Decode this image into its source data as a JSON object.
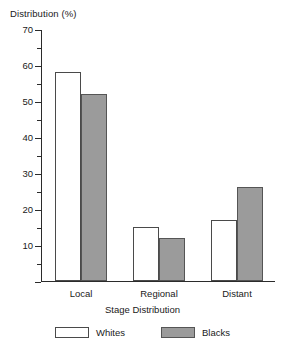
{
  "chart_data": {
    "type": "bar",
    "title": "",
    "ylabel": "Distribution (%)",
    "xlabel": "Stage Distribution",
    "categories": [
      "Local",
      "Regional",
      "Distant"
    ],
    "series": [
      {
        "name": "Whites",
        "values": [
          58,
          15,
          17
        ],
        "color": "#ffffff"
      },
      {
        "name": "Blacks",
        "values": [
          52,
          12,
          26
        ],
        "color": "#9b9b9b"
      }
    ],
    "ylim": [
      0,
      70
    ],
    "y_major_ticks": [
      0,
      10,
      20,
      30,
      40,
      50,
      60,
      70
    ],
    "y_major_tick_labels": [
      "",
      "10",
      "20",
      "30",
      "40",
      "50",
      "60",
      "70"
    ],
    "y_minor_ticks": [
      5,
      15,
      25,
      35,
      45,
      55,
      65
    ],
    "grid": false,
    "legend_position": "bottom"
  },
  "legend": {
    "items": [
      {
        "label": "Whites",
        "swatch": "white-swatch"
      },
      {
        "label": "Blacks",
        "swatch": "gray-swatch"
      }
    ]
  }
}
